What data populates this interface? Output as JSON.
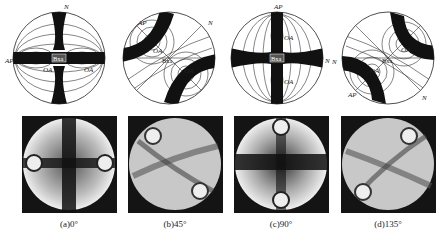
{
  "figure": {
    "panels": [
      {
        "id": "a",
        "caption": "(a)0°",
        "labels": {
          "normal": "N",
          "normal_sub": "m",
          "axial_plane": "AP",
          "optic_axis": "OA",
          "bxa": "Bxa"
        }
      },
      {
        "id": "b",
        "caption": "(b)45°",
        "labels": {
          "normal": "N",
          "normal_sub": "m",
          "axial_plane": "AP",
          "optic_axis": "OA",
          "bxa": "Bxa"
        }
      },
      {
        "id": "c",
        "caption": "(c)90°",
        "labels": {
          "normal": "N",
          "normal_sub": "m",
          "axial_plane": "AP",
          "optic_axis": "OA",
          "bxa": "Bxa"
        }
      },
      {
        "id": "d",
        "caption": "(d)135°",
        "labels": {
          "normal": "N",
          "normal_sub": "m",
          "axial_plane": "AP",
          "optic_axis": "OA",
          "bxa": "Bxa"
        }
      }
    ]
  }
}
